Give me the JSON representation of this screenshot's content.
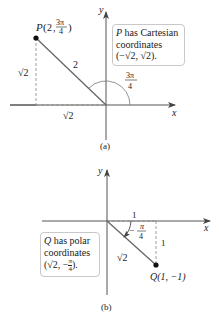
{
  "figure_a": {
    "caption": "(a)",
    "x_axis_label": "x",
    "y_axis_label": "y",
    "point_label": "P",
    "point_polar_r": "2",
    "point_polar_theta_num": "3π",
    "point_polar_theta_den": "4",
    "radius_label": "2",
    "angle_label_num": "3π",
    "angle_label_den": "4",
    "vertical_leg_label": "√2",
    "horizontal_leg_label": "√2",
    "note_line1_var": "P",
    "note_line1_rest": " has Cartesian",
    "note_line2": "coordinates",
    "note_line3": "(−√2, √2)."
  },
  "figure_b": {
    "caption": "(b)",
    "x_axis_label": "x",
    "y_axis_label": "y",
    "point_label": "Q(1, −1)",
    "radius_label": "√2",
    "angle_label_num": "π",
    "angle_label_den": "4",
    "angle_label_sign": "−",
    "horizontal_leg_label": "1",
    "vertical_leg_label": "1",
    "note_line1_var": "Q",
    "note_line1_rest": " has polar",
    "note_line2": "coordinates",
    "note_line3_a": "(√2, −",
    "note_line3_num": "π",
    "note_line3_den": "4",
    "note_line3_b": ")."
  }
}
